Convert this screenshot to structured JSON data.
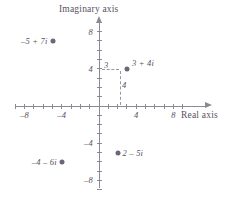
{
  "figure": {
    "type": "complex-plane-plot",
    "background_color": "#ffffff",
    "axis_color": "#8c8894",
    "point_color": "#6f6578",
    "text_color": "#595060"
  },
  "axes": {
    "imaginary_title": "Imaginary axis",
    "real_title": "Real axis",
    "real_range": [
      -9,
      9
    ],
    "imaginary_range": [
      -9,
      9
    ],
    "tick_step": 1,
    "labeled_ticks_x": [
      {
        "value": -8,
        "label": "–8"
      },
      {
        "value": -4,
        "label": "–4"
      },
      {
        "value": 4,
        "label": "4"
      },
      {
        "value": 8,
        "label": "8"
      }
    ],
    "labeled_ticks_y": [
      {
        "value": 8,
        "label": "8"
      },
      {
        "value": 4,
        "label": "4"
      },
      {
        "value": -4,
        "label": "–4"
      },
      {
        "value": -8,
        "label": "–8"
      }
    ]
  },
  "chart_data": {
    "type": "scatter",
    "title": "",
    "xlabel": "Real axis",
    "ylabel": "Imaginary axis",
    "xlim": [
      -9,
      9
    ],
    "ylim": [
      -9,
      9
    ],
    "grid": false,
    "legend": "none",
    "points": [
      {
        "label": "–5 + 7i",
        "real": -5,
        "imaginary": 7,
        "label_side": "left"
      },
      {
        "label": "3 + 4i",
        "real": 3,
        "imaginary": 4,
        "label_side": "right"
      },
      {
        "label": "2 – 5i",
        "real": 2,
        "imaginary": -5,
        "label_side": "right"
      },
      {
        "label": "–4 – 6i",
        "real": -4,
        "imaginary": -6,
        "label_side": "left"
      }
    ],
    "annotations": [
      {
        "name": "real-component-guide",
        "label": "3",
        "from": [
          0,
          4
        ],
        "to": [
          3,
          4
        ],
        "style": "dashed"
      },
      {
        "name": "imaginary-component-guide",
        "label": "4",
        "from": [
          3,
          4
        ],
        "to": [
          3,
          0
        ],
        "style": "dashed"
      }
    ]
  }
}
